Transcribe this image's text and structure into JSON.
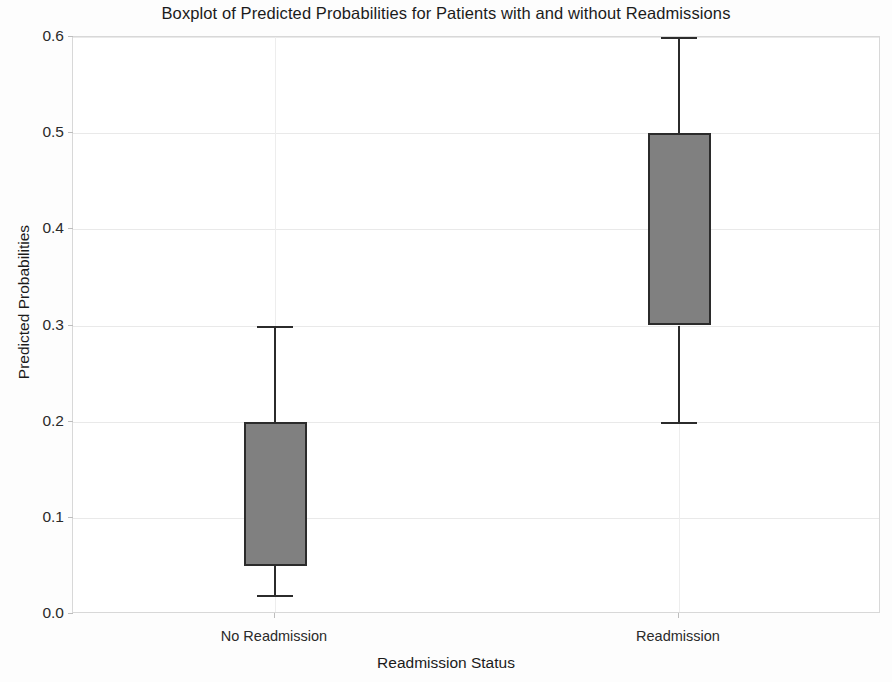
{
  "chart_data": {
    "type": "box",
    "title": "Boxplot of Predicted Probabilities for Patients with and without Readmissions",
    "xlabel": "Readmission Status",
    "ylabel": "Predicted Probabilities",
    "categories": [
      "No Readmission",
      "Readmission"
    ],
    "ylim": [
      0.0,
      0.6
    ],
    "ytick_labels": [
      "0.0",
      "0.1",
      "0.2",
      "0.3",
      "0.4",
      "0.5",
      "0.6"
    ],
    "ytick_values": [
      0.0,
      0.1,
      0.2,
      0.3,
      0.4,
      0.5,
      0.6
    ],
    "grid": true,
    "legend": "none",
    "box_fill_color": "#808080",
    "box_edge_color": "#2b2b2b",
    "gridline_color": "#e9e9e9",
    "boxes": [
      {
        "label": "No Readmission",
        "whisker_low": 0.02,
        "q1": 0.05,
        "median": 0.05,
        "q3": 0.2,
        "whisker_high": 0.3,
        "median_visible": false
      },
      {
        "label": "Readmission",
        "whisker_low": 0.2,
        "q1": 0.3,
        "median": 0.3,
        "q3": 0.5,
        "whisker_high": 0.6,
        "median_visible": false
      }
    ]
  }
}
